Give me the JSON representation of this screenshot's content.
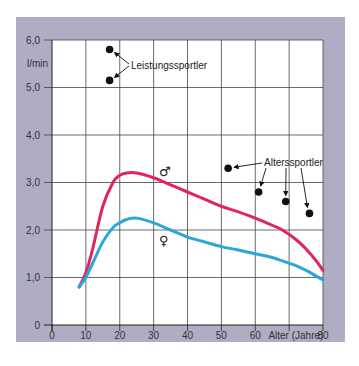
{
  "chart_data": {
    "type": "line",
    "title": "",
    "xlabel": "Alter (Jahre)",
    "ylabel": "l/min",
    "xlim": [
      0,
      80
    ],
    "ylim": [
      0,
      6.0
    ],
    "x_ticks": [
      "0",
      "10",
      "20",
      "30",
      "40",
      "50",
      "60",
      "80"
    ],
    "y_ticks": [
      "0",
      "1,0",
      "2,0",
      "3,0",
      "4,0",
      "5,0",
      "6,0"
    ],
    "grid": true,
    "series": [
      {
        "name": "♂",
        "color": "#e0245e",
        "x": [
          8,
          10,
          12,
          15,
          18,
          20,
          22,
          25,
          30,
          35,
          40,
          45,
          50,
          55,
          60,
          65,
          68,
          72,
          75,
          78,
          80
        ],
        "values": [
          0.8,
          1.1,
          1.6,
          2.5,
          3.0,
          3.15,
          3.2,
          3.2,
          3.1,
          2.95,
          2.8,
          2.65,
          2.5,
          2.38,
          2.25,
          2.1,
          2.0,
          1.8,
          1.6,
          1.35,
          1.15
        ]
      },
      {
        "name": "♀",
        "color": "#2aa7d8",
        "x": [
          8,
          10,
          12,
          15,
          18,
          20,
          22,
          25,
          30,
          35,
          40,
          45,
          50,
          55,
          60,
          65,
          68,
          72,
          75,
          78,
          80
        ],
        "values": [
          0.8,
          1.0,
          1.3,
          1.75,
          2.05,
          2.15,
          2.22,
          2.25,
          2.15,
          2.0,
          1.85,
          1.75,
          1.65,
          1.58,
          1.5,
          1.42,
          1.35,
          1.25,
          1.15,
          1.03,
          0.95
        ]
      }
    ],
    "points": [
      {
        "group": "Leistungssportler",
        "x": 17,
        "y": 5.8
      },
      {
        "group": "Leistungssportler",
        "x": 17,
        "y": 5.15
      },
      {
        "group": "Alterssportler",
        "x": 52,
        "y": 3.3
      },
      {
        "group": "Alterssportler",
        "x": 61,
        "y": 2.8
      },
      {
        "group": "Alterssportler",
        "x": 69,
        "y": 2.6
      },
      {
        "group": "Alterssportler",
        "x": 76,
        "y": 2.35
      }
    ],
    "annotations": [
      {
        "text": "Leistungssportler",
        "x": 23,
        "y": 5.5
      },
      {
        "text": "Alterssportler",
        "x": 59,
        "y": 3.35
      },
      {
        "text": "♂",
        "x": 33,
        "y": 3.35
      },
      {
        "text": "♀",
        "x": 33,
        "y": 1.75
      }
    ]
  },
  "labels": {
    "unit": "l/min",
    "x_axis_title": "Alter (Jahre)",
    "leistungssportler": "Leistungssportler",
    "alterssportler": "Alterssportler",
    "male_symbol": "♂",
    "female_symbol": "♀"
  },
  "colors": {
    "frame": "#aaa8c0",
    "male": "#e0245e",
    "female": "#2aa7d8",
    "grid": "#444444"
  }
}
